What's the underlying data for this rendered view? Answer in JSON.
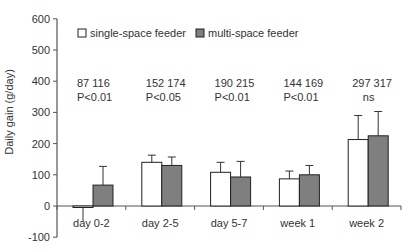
{
  "chart_data": {
    "type": "bar",
    "title": "",
    "xlabel": "",
    "ylabel": "Daily gain (g/day)",
    "ylim": [
      -100,
      600
    ],
    "yticks": [
      -100,
      0,
      100,
      200,
      300,
      400,
      500,
      600
    ],
    "grid": false,
    "legend_position": "top",
    "categories": [
      "day 0-2",
      "day 2-5",
      "day 5-7",
      "week 1",
      "week 2"
    ],
    "series": [
      {
        "name": "single-space feeder",
        "color": "#ffffff",
        "values": [
          -3,
          140,
          108,
          87,
          213
        ],
        "error": [
          47,
          23,
          32,
          25,
          77
        ]
      },
      {
        "name": "multi-space feeder",
        "color": "#7f7f7f",
        "values": [
          67,
          130,
          93,
          100,
          225
        ],
        "error": [
          60,
          27,
          50,
          30,
          78
        ]
      }
    ],
    "annotations": [
      {
        "category": "day 0-2",
        "counts": "87  116",
        "significance": "P<0.01"
      },
      {
        "category": "day 2-5",
        "counts": "152  174",
        "significance": "P<0.05"
      },
      {
        "category": "day 5-7",
        "counts": "190  215",
        "significance": "P<0.01"
      },
      {
        "category": "week 1",
        "counts": "144  169",
        "significance": "P<0.01"
      },
      {
        "category": "week 2",
        "counts": "297  317",
        "significance": "ns"
      }
    ]
  }
}
